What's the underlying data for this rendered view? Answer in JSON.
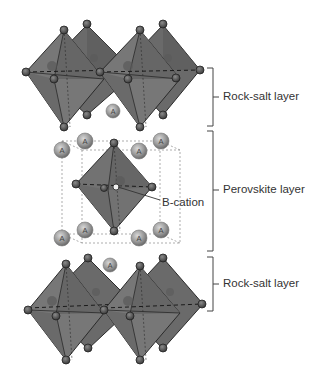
{
  "figure": {
    "colors": {
      "octahedron_fill": "#6f6f6f",
      "octahedron_dark": "#4f4f4f",
      "octahedron_edge": "#2a2a2a",
      "atom_fill": "#555555",
      "a_cation_fill": "#8a8a8a",
      "label_text": "#333333",
      "bracket": "#444444",
      "unit_cell_dash": "#777777"
    },
    "labels": {
      "top_layer": "Rock-salt  layer",
      "middle_layer": "Perovskite layer",
      "b_cation": "B-cation",
      "bottom_layer": "Rock-salt  layer"
    },
    "a_cation_symbol": "A"
  }
}
